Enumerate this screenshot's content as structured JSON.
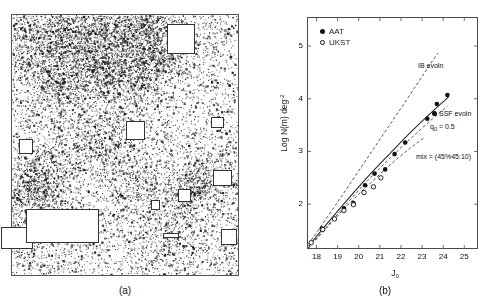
{
  "figure": {
    "panel_a": {
      "caption": "(a)",
      "description": "galaxy-star-field-density-map",
      "mask_boxes": [
        {
          "x": 0.745,
          "y": 0.095,
          "w": 0.125,
          "h": 0.115
        },
        {
          "x": 0.545,
          "y": 0.445,
          "w": 0.085,
          "h": 0.075
        },
        {
          "x": 0.065,
          "y": 0.505,
          "w": 0.06,
          "h": 0.055
        },
        {
          "x": 0.905,
          "y": 0.415,
          "w": 0.06,
          "h": 0.04
        },
        {
          "x": 0.928,
          "y": 0.625,
          "w": 0.08,
          "h": 0.06
        },
        {
          "x": 0.76,
          "y": 0.692,
          "w": 0.055,
          "h": 0.05
        },
        {
          "x": 0.635,
          "y": 0.73,
          "w": 0.04,
          "h": 0.038
        },
        {
          "x": 0.028,
          "y": 0.855,
          "w": 0.14,
          "h": 0.085
        },
        {
          "x": 0.225,
          "y": 0.81,
          "w": 0.32,
          "h": 0.13
        },
        {
          "x": 0.7,
          "y": 0.845,
          "w": 0.07,
          "h": 0.022
        },
        {
          "x": 0.955,
          "y": 0.85,
          "w": 0.07,
          "h": 0.06
        }
      ]
    },
    "panel_b": {
      "caption": "(b)"
    }
  },
  "chart_data": {
    "type": "scatter",
    "title": "",
    "xlabel": "J0",
    "xlabel_base": "J",
    "xlabel_sub": "0",
    "ylabel": "Log N(m) deg-2",
    "ylabel_base": "Log N(m) deg",
    "ylabel_sup": "-2",
    "xlim": [
      17.55,
      25.65
    ],
    "ylim": [
      1.15,
      5.55
    ],
    "xticks": [
      18,
      19,
      20,
      21,
      22,
      23,
      24,
      25
    ],
    "yticks": [
      2,
      3,
      4,
      5
    ],
    "grid": false,
    "legend_position": "top-left",
    "legend": [
      {
        "label": "AAT",
        "marker": "filled-circle"
      },
      {
        "label": "UKST",
        "marker": "open-circle"
      }
    ],
    "series": [
      {
        "name": "AAT",
        "marker": "filled-circle",
        "points": [
          [
            18.25,
            1.54
          ],
          [
            19.3,
            1.92
          ],
          [
            19.75,
            2.02
          ],
          [
            20.3,
            2.36
          ],
          [
            20.75,
            2.58
          ],
          [
            21.25,
            2.66
          ],
          [
            21.7,
            2.95
          ],
          [
            22.2,
            3.17
          ],
          [
            23.25,
            3.62
          ],
          [
            23.7,
            3.9
          ],
          [
            24.2,
            4.07
          ]
        ]
      },
      {
        "name": "UKST",
        "marker": "open-circle",
        "points": [
          [
            17.75,
            1.27
          ],
          [
            18.3,
            1.52
          ],
          [
            18.85,
            1.72
          ],
          [
            19.3,
            1.88
          ],
          [
            19.75,
            1.99
          ],
          [
            20.25,
            2.22
          ],
          [
            20.7,
            2.33
          ],
          [
            21.05,
            2.5
          ]
        ]
      }
    ],
    "curves": [
      {
        "name": "IB evoln",
        "label": "IB evoln",
        "style": "dashed",
        "points": [
          [
            17.62,
            1.24
          ],
          [
            19.0,
            2.04
          ],
          [
            20.5,
            2.93
          ],
          [
            22.0,
            3.82
          ],
          [
            23.4,
            4.66
          ],
          [
            23.75,
            4.87
          ]
        ]
      },
      {
        "name": "SSF evoln",
        "label": "SSF evoln",
        "style": "solid",
        "points": [
          [
            17.62,
            1.2
          ],
          [
            18.5,
            1.63
          ],
          [
            19.5,
            2.1
          ],
          [
            20.5,
            2.55
          ],
          [
            21.5,
            2.97
          ],
          [
            22.5,
            3.38
          ],
          [
            23.5,
            3.76
          ],
          [
            24.25,
            4.03
          ]
        ]
      },
      {
        "name": "q0 = 0.5",
        "label": "q0 = 0.5",
        "label_base": "q",
        "label_sub": "0",
        "label_tail": " = 0.5",
        "style": "dashed",
        "points": [
          [
            17.62,
            1.17
          ],
          [
            18.5,
            1.58
          ],
          [
            19.5,
            2.04
          ],
          [
            20.5,
            2.48
          ],
          [
            21.5,
            2.88
          ],
          [
            22.5,
            3.26
          ],
          [
            23.5,
            3.62
          ],
          [
            24.2,
            3.86
          ]
        ]
      },
      {
        "name": "mix",
        "label": "mix = (45%45:10)",
        "style": "dashed",
        "points": [
          [
            17.62,
            1.17
          ],
          [
            18.5,
            1.56
          ],
          [
            19.5,
            1.99
          ],
          [
            20.5,
            2.38
          ],
          [
            21.5,
            2.75
          ],
          [
            22.4,
            3.05
          ],
          [
            23.1,
            3.26
          ]
        ]
      }
    ]
  }
}
